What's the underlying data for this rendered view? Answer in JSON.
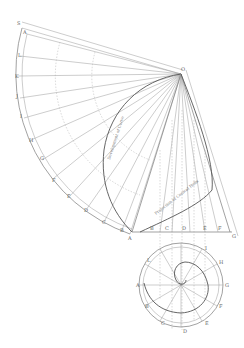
{
  "diagram": {
    "type": "geometric construction",
    "apex_label": "O",
    "development_captions": {
      "upper": "Development of Curve",
      "lower": "Projection of Conical Helix"
    },
    "arc_labels": [
      "S",
      "A",
      "L",
      "K",
      "J",
      "I",
      "H",
      "G",
      "F",
      "E",
      "D",
      "C",
      "B",
      "A"
    ],
    "baseline_labels": [
      "A",
      "B",
      "C",
      "D",
      "E",
      "F",
      "G"
    ],
    "plan_circle_labels": [
      "A",
      "B",
      "C",
      "D",
      "E",
      "F",
      "G",
      "H",
      "I",
      "J",
      "K",
      "L"
    ],
    "colors": {
      "line": "#9a9a9a",
      "curve": "#555555",
      "background": "#ffffff"
    }
  }
}
